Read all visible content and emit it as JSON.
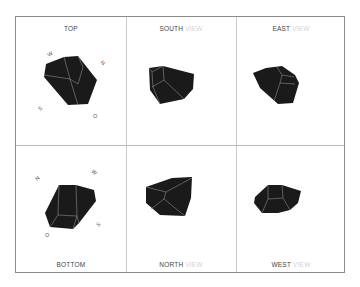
{
  "views": [
    {
      "id": "top",
      "name": "TOP",
      "suffix": "",
      "compass": [
        "W",
        "N",
        "S",
        "O"
      ]
    },
    {
      "id": "south",
      "name": "SOUTH",
      "suffix": "VIEW"
    },
    {
      "id": "east",
      "name": "EAST",
      "suffix": "VIEW"
    },
    {
      "id": "bottom",
      "name": "BOTTOM",
      "suffix": "",
      "compass": [
        "N",
        "W",
        "O",
        "S"
      ]
    },
    {
      "id": "north",
      "name": "NORTH",
      "suffix": "VIEW"
    },
    {
      "id": "west",
      "name": "WEST",
      "suffix": "VIEW"
    }
  ],
  "colors": {
    "shape_fill": "#1a1a1a",
    "edge_line": "#8c8c8c",
    "frame": "#8a8a8a"
  }
}
